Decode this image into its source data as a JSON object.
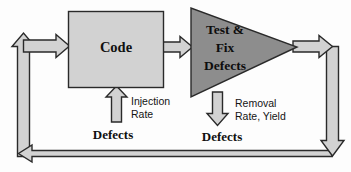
{
  "diagram": {
    "nodes": {
      "code": {
        "label": "Code",
        "shape": "rectangle",
        "fill": "#d2d2d2",
        "stroke": "#2a2a2a"
      },
      "test_fix": {
        "label_line1": "Test &",
        "label_line2": "Fix",
        "label_line3": "Defects",
        "shape": "triangle",
        "fill": "#8d8d8d",
        "stroke": "#2a2a2a"
      }
    },
    "edge_labels": {
      "injection_line1": "Injection",
      "injection_line2": "Rate",
      "removal_line1": "Removal",
      "removal_line2": "Rate, Yield",
      "defects_in": "Defects",
      "defects_out": "Defects"
    },
    "arrows": {
      "input_to_code": "arrow-right-into-code",
      "code_to_test": "arrow-right-code-to-test",
      "injection_up": "arrow-up-injection",
      "removal_down": "arrow-down-removal",
      "test_to_right": "arrow-right-out-of-test",
      "feedback_right_down": "arrow-down-right-side",
      "feedback_bottom_left": "arrow-left-bottom",
      "feedback_left_up": "arrow-up-left-side"
    },
    "colors": {
      "light_gray": "#d2d2d2",
      "mid_gray": "#8d8d8d",
      "outline": "#2a2a2a",
      "background": "#fdfdfd"
    }
  }
}
